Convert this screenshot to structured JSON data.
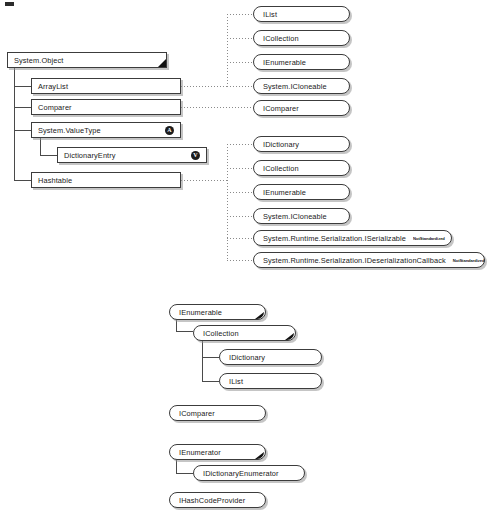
{
  "diagram": {
    "badge_abstract": "A",
    "badge_valuetype": "V",
    "not_standardized_tag": "NotStandardized"
  },
  "class_hierarchy": {
    "root": "System.Object",
    "nodes": [
      {
        "name": "System.Object",
        "level": 0
      },
      {
        "name": "ArrayList",
        "level": 1
      },
      {
        "name": "Comparer",
        "level": 1
      },
      {
        "name": "System.ValueType",
        "level": 1,
        "badge": "A"
      },
      {
        "name": "DictionaryEntry",
        "level": 2,
        "badge": "V"
      },
      {
        "name": "Hashtable",
        "level": 1
      }
    ]
  },
  "arraylist_interfaces": [
    {
      "name": "IList"
    },
    {
      "name": "ICollection"
    },
    {
      "name": "IEnumerable"
    },
    {
      "name": "System.ICloneable"
    }
  ],
  "comparer_interfaces": [
    {
      "name": "IComparer"
    }
  ],
  "hashtable_interfaces": [
    {
      "name": "IDictionary",
      "tag": ""
    },
    {
      "name": "ICollection",
      "tag": ""
    },
    {
      "name": "IEnumerable",
      "tag": ""
    },
    {
      "name": "System.ICloneable",
      "tag": ""
    },
    {
      "name": "System.Runtime.Serialization.ISerializable",
      "tag": "NotStandardized"
    },
    {
      "name": "System.Runtime.Serialization.IDeserializationCallback",
      "tag": "NotStandardized"
    }
  ],
  "interface_hierarchy": {
    "group_collections": [
      {
        "name": "IEnumerable",
        "level": 0
      },
      {
        "name": "ICollection",
        "level": 1
      },
      {
        "name": "IDictionary",
        "level": 2
      },
      {
        "name": "IList",
        "level": 2
      }
    ],
    "group_comparer": [
      {
        "name": "IComparer",
        "level": 0
      }
    ],
    "group_enumerator": [
      {
        "name": "IEnumerator",
        "level": 0
      },
      {
        "name": "IDictionaryEnumerator",
        "level": 1
      }
    ],
    "group_hashcode": [
      {
        "name": "IHashCodeProvider",
        "level": 0
      }
    ]
  },
  "colors": {
    "box_border": "#3c3c3c",
    "shadow": "#969696",
    "line": "#4a4a4a",
    "dotted_line": "#8a8a8a",
    "badge_fill": "#1c1c1c",
    "fold_fill": "#111111",
    "background": "#ffffff"
  }
}
